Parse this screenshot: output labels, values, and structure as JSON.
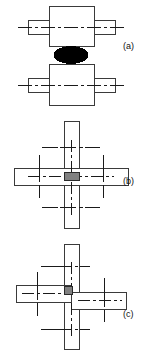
{
  "figure": {
    "background_color": "#ffffff",
    "outline_color": "#3a3a3a",
    "centerline_color": "#1a1a1a",
    "nugget_black": "#000000",
    "nugget_gray": "#808080",
    "fill_color": "#ffffff",
    "width": 161,
    "height": 358
  },
  "panels": [
    {
      "id": "a",
      "label": "(a)",
      "view": "elevation",
      "description": "Two flanged blocks meeting face to face with a dark elliptical weld nugget between them",
      "parts": [
        {
          "name": "upper-block",
          "shape": "rect",
          "x": 49,
          "y": 6,
          "w": 45,
          "h": 40
        },
        {
          "name": "upper-left-arm",
          "shape": "rect",
          "x": 28,
          "y": 20,
          "w": 21,
          "h": 14
        },
        {
          "name": "upper-right-arm",
          "shape": "rect",
          "x": 94,
          "y": 20,
          "w": 21,
          "h": 14
        },
        {
          "name": "weld-nugget",
          "shape": "ellipse",
          "cx": 71,
          "cy": 55,
          "rx": 17,
          "ry": 8,
          "fill": "#000000"
        },
        {
          "name": "lower-block",
          "shape": "rect",
          "x": 49,
          "y": 64,
          "w": 45,
          "h": 41
        },
        {
          "name": "lower-left-arm",
          "shape": "rect",
          "x": 28,
          "y": 78,
          "w": 21,
          "h": 14
        },
        {
          "name": "lower-right-arm",
          "shape": "rect",
          "x": 94,
          "y": 78,
          "w": 21,
          "h": 14
        }
      ],
      "centerlines": [
        {
          "name": "upper-horizontal-centerline",
          "x1": 18,
          "y1": 27,
          "x2": 125,
          "y2": 27
        },
        {
          "name": "lower-horizontal-centerline",
          "x1": 18,
          "y1": 85,
          "x2": 125,
          "y2": 85
        }
      ]
    },
    {
      "id": "b",
      "label": "(b)",
      "view": "plan-cross-joint",
      "description": "Vertical bar crossing a horizontal bar at right angles with a grey weld nugget at the intersection",
      "parts": [
        {
          "name": "vertical-bar",
          "shape": "rect",
          "x": 64,
          "y": 121,
          "w": 15,
          "h": 107
        },
        {
          "name": "horizontal-bar",
          "shape": "rect",
          "x": 14,
          "y": 168,
          "w": 115,
          "h": 17
        },
        {
          "name": "weld-nugget",
          "shape": "rect",
          "x": 64,
          "y": 172,
          "w": 15,
          "h": 8,
          "fill": "#808080"
        }
      ],
      "centerlines": [
        {
          "name": "upper-cross-horizontal-centerline",
          "x1": 42,
          "y1": 147,
          "x2": 100,
          "y2": 147
        },
        {
          "name": "lower-cross-horizontal-centerline",
          "x1": 42,
          "y1": 207,
          "x2": 100,
          "y2": 207
        },
        {
          "name": "left-cross-vertical-centerline",
          "x1": 39,
          "y1": 155,
          "x2": 39,
          "y2": 198
        },
        {
          "name": "right-cross-vertical-centerline",
          "x1": 103,
          "y1": 155,
          "x2": 103,
          "y2": 198
        },
        {
          "name": "bar-vertical-centerline",
          "x1": 71,
          "y1": 140,
          "x2": 71,
          "y2": 215
        },
        {
          "name": "bar-horizontal-centerline",
          "x1": 30,
          "y1": 176,
          "x2": 112,
          "y2": 176
        }
      ]
    },
    {
      "id": "c",
      "label": "(c)",
      "view": "plan-offset-lap-joint",
      "description": "Vertical bar with two horizontal bars staggered on opposite sides, grey weld nugget at the small overlap",
      "parts": [
        {
          "name": "vertical-bar",
          "shape": "rect",
          "x": 64,
          "y": 244,
          "w": 15,
          "h": 106
        },
        {
          "name": "left-horizontal-bar",
          "shape": "rect",
          "x": 16,
          "y": 285,
          "w": 55,
          "h": 17
        },
        {
          "name": "right-horizontal-bar",
          "shape": "rect",
          "x": 71,
          "y": 292,
          "w": 55,
          "h": 17
        },
        {
          "name": "weld-nugget",
          "shape": "rect",
          "x": 65,
          "y": 286,
          "w": 8,
          "h": 8,
          "fill": "#808080"
        }
      ],
      "centerlines": [
        {
          "name": "upper-cross-horizontal-centerline",
          "x1": 41,
          "y1": 266,
          "x2": 90,
          "y2": 266
        },
        {
          "name": "lower-cross-horizontal-centerline",
          "x1": 41,
          "y1": 329,
          "x2": 90,
          "y2": 329
        },
        {
          "name": "left-cross-vertical-centerline",
          "x1": 37,
          "y1": 272,
          "x2": 37,
          "y2": 316
        },
        {
          "name": "right-cross-vertical-centerline",
          "x1": 104,
          "y1": 278,
          "x2": 104,
          "y2": 322
        },
        {
          "name": "vertical-bar-centerline",
          "x1": 71,
          "y1": 262,
          "x2": 71,
          "y2": 334
        },
        {
          "name": "left-bar-centerline",
          "x1": 22,
          "y1": 293,
          "x2": 69,
          "y2": 293
        },
        {
          "name": "right-bar-centerline",
          "x1": 76,
          "y1": 300,
          "x2": 120,
          "y2": 300
        }
      ]
    }
  ]
}
